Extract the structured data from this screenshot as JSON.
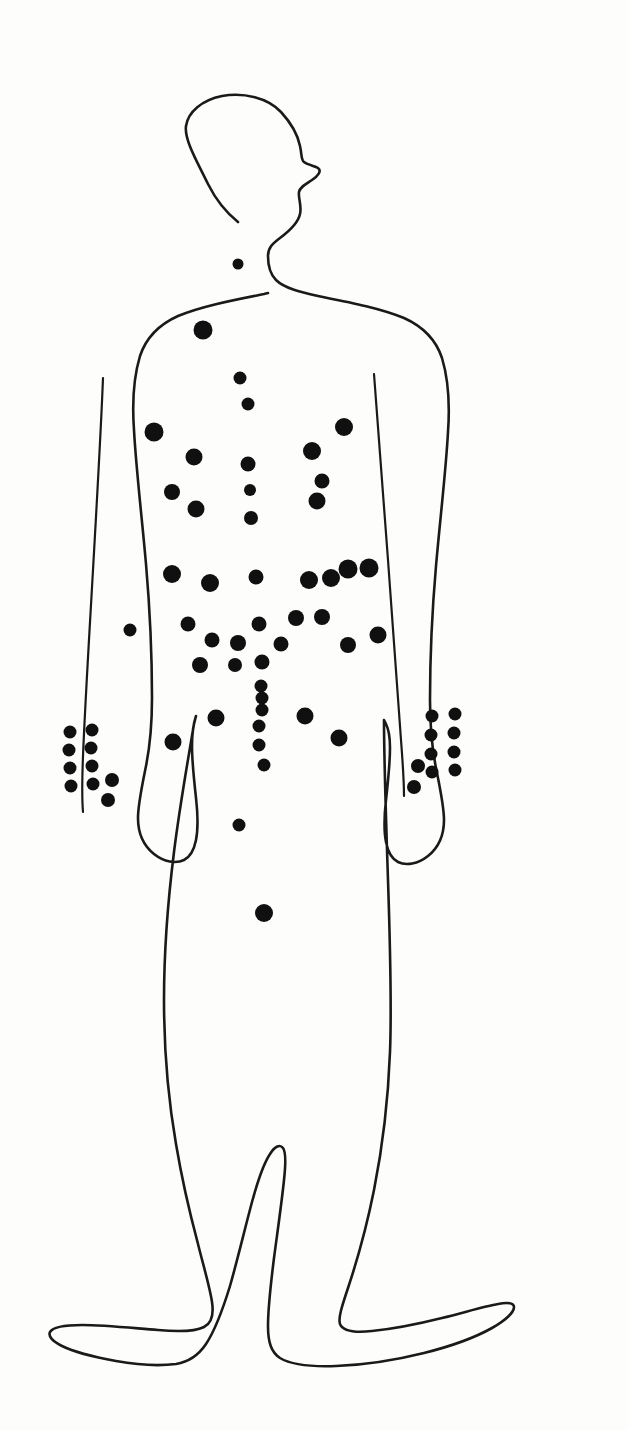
{
  "document": {
    "title": "Body Map Diagram",
    "figure_name": "human-body-outline-anterior",
    "description": "Hand-drawn outline of a standing human figure seen from the front with the head in right-facing profile, marked with filled black dots.",
    "background_color": "#fdfdfc",
    "outline_color": "#1a1a1a",
    "marker_color": "#101010",
    "marker_count": 72
  },
  "chart_data": {
    "type": "scatter",
    "title": "Body Map Diagram",
    "subtitle": "",
    "xlabel": "",
    "ylabel": "",
    "xlim": [
      0,
      628
    ],
    "ylim": [
      0,
      1430
    ],
    "grid": false,
    "legend": "none",
    "units": "pixels",
    "series": [
      {
        "name": "markers",
        "color": "#101010",
        "points": [
          {
            "region": "neck-suprasternal",
            "x": 238,
            "y": 264,
            "r": 5.5
          },
          {
            "region": "upper-chest-midline",
            "x": 203,
            "y": 330,
            "r": 9.5
          },
          {
            "region": "sternum-upper",
            "x": 240,
            "y": 378,
            "r": 6.5
          },
          {
            "region": "sternum-mid",
            "x": 248,
            "y": 404,
            "r": 6.5
          },
          {
            "region": "left-chest-lateral",
            "x": 154,
            "y": 432,
            "r": 9.5
          },
          {
            "region": "right-chest-lateral",
            "x": 344,
            "y": 427,
            "r": 9.0
          },
          {
            "region": "left-chest-inner",
            "x": 194,
            "y": 457,
            "r": 8.5
          },
          {
            "region": "right-chest-inner",
            "x": 312,
            "y": 451,
            "r": 9.0
          },
          {
            "region": "sternum-lower",
            "x": 248,
            "y": 464,
            "r": 7.5
          },
          {
            "region": "left-chest-low",
            "x": 172,
            "y": 492,
            "r": 8.0
          },
          {
            "region": "sternum-xiphoid",
            "x": 250,
            "y": 490,
            "r": 6.0
          },
          {
            "region": "right-chest-low",
            "x": 322,
            "y": 481,
            "r": 7.5
          },
          {
            "region": "left-chest-lower2",
            "x": 196,
            "y": 509,
            "r": 8.5
          },
          {
            "region": "right-chest-lower2",
            "x": 317,
            "y": 501,
            "r": 8.5
          },
          {
            "region": "epigastric-midline",
            "x": 251,
            "y": 518,
            "r": 7.0
          },
          {
            "region": "left-upper-abdomen",
            "x": 172,
            "y": 574,
            "r": 9.0
          },
          {
            "region": "left-upper-abdomen-inner",
            "x": 210,
            "y": 583,
            "r": 9.0
          },
          {
            "region": "epigastrium",
            "x": 256,
            "y": 577,
            "r": 7.5
          },
          {
            "region": "right-upper-abdomen-a",
            "x": 309,
            "y": 580,
            "r": 9.0
          },
          {
            "region": "right-upper-abdomen-b",
            "x": 331,
            "y": 578,
            "r": 9.0
          },
          {
            "region": "right-upper-abdomen-c",
            "x": 348,
            "y": 569,
            "r": 9.5
          },
          {
            "region": "right-upper-abdomen-d",
            "x": 369,
            "y": 568,
            "r": 9.5
          },
          {
            "region": "left-flank-outer",
            "x": 130,
            "y": 630,
            "r": 6.5
          },
          {
            "region": "left-abdomen-mid",
            "x": 188,
            "y": 624,
            "r": 7.5
          },
          {
            "region": "umbilical-upper",
            "x": 259,
            "y": 624,
            "r": 7.5
          },
          {
            "region": "right-abdomen-mid-a",
            "x": 296,
            "y": 618,
            "r": 8.0
          },
          {
            "region": "right-abdomen-mid-b",
            "x": 322,
            "y": 617,
            "r": 8.0
          },
          {
            "region": "right-flank-outer",
            "x": 378,
            "y": 635,
            "r": 8.5
          },
          {
            "region": "left-abdomen-inner",
            "x": 212,
            "y": 640,
            "r": 7.5
          },
          {
            "region": "umbilical-left",
            "x": 238,
            "y": 643,
            "r": 8.0
          },
          {
            "region": "umbilical-right",
            "x": 281,
            "y": 644,
            "r": 7.5
          },
          {
            "region": "left-abdomen-low",
            "x": 200,
            "y": 665,
            "r": 8.0
          },
          {
            "region": "midline-below-umbilicus-a",
            "x": 235,
            "y": 665,
            "r": 7.0
          },
          {
            "region": "midline-below-umbilicus-b",
            "x": 262,
            "y": 662,
            "r": 7.5
          },
          {
            "region": "right-abdomen-low",
            "x": 348,
            "y": 645,
            "r": 8.0
          },
          {
            "region": "midline-chain-1",
            "x": 261,
            "y": 686,
            "r": 6.5
          },
          {
            "region": "midline-chain-2",
            "x": 262,
            "y": 698,
            "r": 6.5
          },
          {
            "region": "midline-chain-3",
            "x": 262,
            "y": 710,
            "r": 6.5
          },
          {
            "region": "midline-chain-4",
            "x": 259,
            "y": 726,
            "r": 6.5
          },
          {
            "region": "midline-chain-5",
            "x": 259,
            "y": 745,
            "r": 6.5
          },
          {
            "region": "midline-chain-6",
            "x": 264,
            "y": 765,
            "r": 6.5
          },
          {
            "region": "left-lower-abdomen-a",
            "x": 216,
            "y": 718,
            "r": 8.5
          },
          {
            "region": "left-lower-abdomen-b",
            "x": 173,
            "y": 742,
            "r": 8.5
          },
          {
            "region": "right-lower-abdomen-a",
            "x": 305,
            "y": 716,
            "r": 8.5
          },
          {
            "region": "right-lower-abdomen-b",
            "x": 339,
            "y": 738,
            "r": 8.5
          },
          {
            "region": "hypogastric",
            "x": 239,
            "y": 825,
            "r": 6.5
          },
          {
            "region": "suprapubic",
            "x": 264,
            "y": 913,
            "r": 9.0
          },
          {
            "region": "left-hand-r1c1",
            "x": 70,
            "y": 732,
            "r": 6.5
          },
          {
            "region": "left-hand-r1c2",
            "x": 92,
            "y": 730,
            "r": 6.5
          },
          {
            "region": "left-hand-r2c1",
            "x": 69,
            "y": 750,
            "r": 6.5
          },
          {
            "region": "left-hand-r2c2",
            "x": 91,
            "y": 748,
            "r": 6.5
          },
          {
            "region": "left-hand-r3c1",
            "x": 70,
            "y": 768,
            "r": 6.5
          },
          {
            "region": "left-hand-r3c2",
            "x": 92,
            "y": 766,
            "r": 6.5
          },
          {
            "region": "left-hand-r4c1",
            "x": 71,
            "y": 786,
            "r": 6.5
          },
          {
            "region": "left-hand-r4c2",
            "x": 93,
            "y": 784,
            "r": 6.5
          },
          {
            "region": "left-hand-outer-a",
            "x": 112,
            "y": 780,
            "r": 7.0
          },
          {
            "region": "left-hand-outer-b",
            "x": 108,
            "y": 800,
            "r": 7.0
          },
          {
            "region": "right-hand-r1c1",
            "x": 432,
            "y": 716,
            "r": 6.5
          },
          {
            "region": "right-hand-r1c2",
            "x": 455,
            "y": 714,
            "r": 6.5
          },
          {
            "region": "right-hand-r2c1",
            "x": 431,
            "y": 735,
            "r": 6.5
          },
          {
            "region": "right-hand-r2c2",
            "x": 454,
            "y": 733,
            "r": 6.5
          },
          {
            "region": "right-hand-r3c1",
            "x": 431,
            "y": 754,
            "r": 6.5
          },
          {
            "region": "right-hand-r3c2",
            "x": 454,
            "y": 752,
            "r": 6.5
          },
          {
            "region": "right-hand-r4c1",
            "x": 432,
            "y": 772,
            "r": 6.5
          },
          {
            "region": "right-hand-r4c2",
            "x": 455,
            "y": 770,
            "r": 6.5
          },
          {
            "region": "right-hand-outer-a",
            "x": 418,
            "y": 766,
            "r": 7.0
          },
          {
            "region": "right-hand-outer-b",
            "x": 414,
            "y": 787,
            "r": 7.0
          }
        ]
      }
    ],
    "annotations": [
      {
        "name": "head-profile",
        "note": "right-facing profile head outline"
      },
      {
        "name": "left-arm-inner-line",
        "note": "inner contour line of left arm"
      },
      {
        "name": "right-arm-inner-line",
        "note": "inner contour line of right arm"
      },
      {
        "name": "feet",
        "note": "both feet splayed outward"
      }
    ]
  }
}
